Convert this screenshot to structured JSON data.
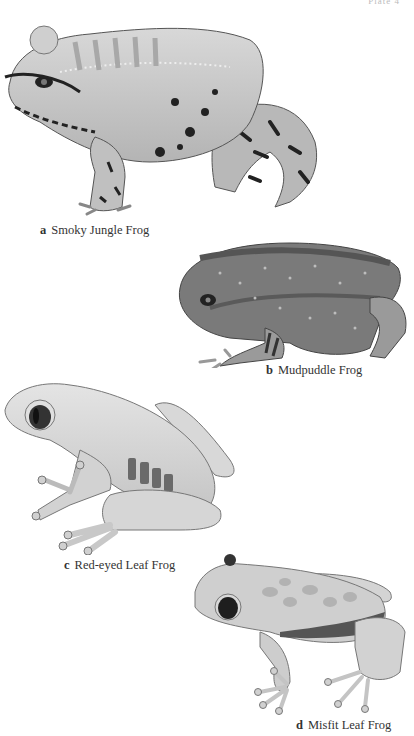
{
  "plate": {
    "label": "Plate 4"
  },
  "figures": [
    {
      "letter": "a",
      "name": "Smoky Jungle Frog"
    },
    {
      "letter": "b",
      "name": "Mudpuddle Frog"
    },
    {
      "letter": "c",
      "name": "Red-eyed Leaf Frog"
    },
    {
      "letter": "d",
      "name": "Misfit Leaf Frog"
    }
  ],
  "colors": {
    "background": "#ffffff",
    "caption_text": "#333333",
    "frog_a_body": "#c4c4c4",
    "frog_b_body": "#7a7a7a",
    "frog_c_body": "#d6d6d6",
    "frog_d_body": "#cfcfcf"
  }
}
